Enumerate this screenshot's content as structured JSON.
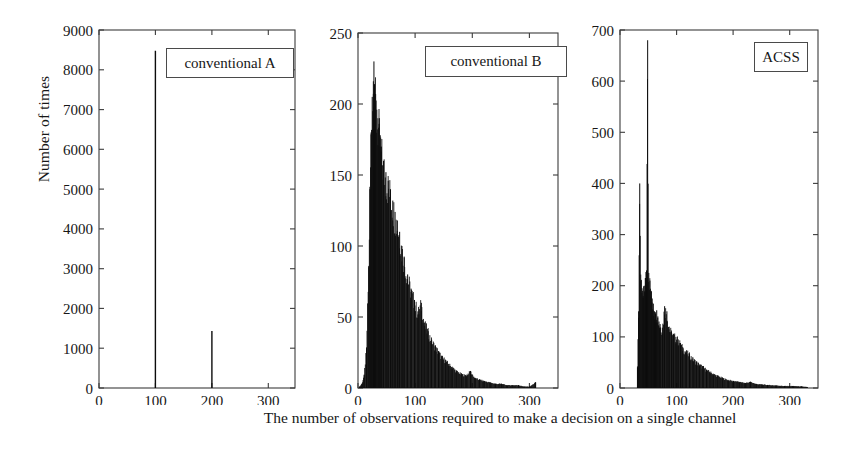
{
  "figure": {
    "xlabel": "The number of observations required to make a decision on a single channel",
    "ylabel": "Number of times"
  },
  "panels": [
    {
      "id": "panel-conventional-a",
      "legend": "conventional A",
      "yticks": [
        "0",
        "1000",
        "2000",
        "3000",
        "4000",
        "5000",
        "6000",
        "7000",
        "8000",
        "9000"
      ],
      "xticks": [
        "0",
        "100",
        "200",
        "300"
      ]
    },
    {
      "id": "panel-conventional-b",
      "legend": "conventional B",
      "yticks": [
        "0",
        "50",
        "100",
        "150",
        "200",
        "250"
      ],
      "xticks": [
        "0",
        "100",
        "200",
        "300"
      ]
    },
    {
      "id": "panel-acss",
      "legend": "ACSS",
      "yticks": [
        "0",
        "100",
        "200",
        "300",
        "400",
        "500",
        "600",
        "700"
      ],
      "xticks": [
        "0",
        "100",
        "200",
        "300"
      ]
    }
  ],
  "chart_data": [
    {
      "type": "bar",
      "title": "conventional A",
      "xlabel": "The number of observations required to make a decision on a single channel",
      "ylabel": "Number of times",
      "xlim": [
        0,
        350
      ],
      "ylim": [
        0,
        9000
      ],
      "xticks": [
        0,
        100,
        200,
        300
      ],
      "yticks": [
        0,
        1000,
        2000,
        3000,
        4000,
        5000,
        6000,
        7000,
        8000,
        9000
      ],
      "grid": false,
      "legend_position": "top-right",
      "note": "Two discrete spikes only; all other bins are zero.",
      "x": [
        100,
        200
      ],
      "values": [
        8480,
        1430
      ]
    },
    {
      "type": "bar",
      "title": "conventional B",
      "xlabel": "The number of observations required to make a decision on a single channel",
      "ylabel": "Number of times",
      "xlim": [
        0,
        350
      ],
      "ylim": [
        0,
        250
      ],
      "xticks": [
        0,
        100,
        200,
        300
      ],
      "yticks": [
        0,
        50,
        100,
        150,
        200,
        250
      ],
      "grid": false,
      "legend_position": "top-right",
      "note": "Right-skewed unimodal histogram, mode near 27, peak 230, long tail to ~310.",
      "x": [
        2,
        6,
        10,
        14,
        18,
        20,
        22,
        24,
        26,
        27,
        28,
        30,
        32,
        34,
        36,
        38,
        40,
        44,
        48,
        52,
        56,
        60,
        64,
        68,
        72,
        76,
        80,
        86,
        92,
        98,
        104,
        110,
        116,
        122,
        128,
        134,
        140,
        146,
        152,
        158,
        164,
        172,
        180,
        188,
        196,
        204,
        212,
        220,
        230,
        240,
        250,
        260,
        270,
        280,
        290,
        300,
        310
      ],
      "values": [
        1,
        3,
        9,
        28,
        86,
        140,
        180,
        205,
        216,
        230,
        214,
        207,
        196,
        190,
        186,
        178,
        170,
        160,
        152,
        146,
        140,
        132,
        124,
        118,
        110,
        100,
        92,
        80,
        70,
        62,
        54,
        60,
        46,
        40,
        34,
        30,
        26,
        22,
        20,
        17,
        15,
        12,
        10,
        9,
        12,
        7,
        6,
        5,
        4,
        3,
        3,
        2,
        2,
        2,
        1,
        1,
        4
      ]
    },
    {
      "type": "bar",
      "title": "ACSS",
      "xlabel": "The number of observations required to make a decision on a single channel",
      "ylabel": "Number of times",
      "xlim": [
        0,
        350
      ],
      "ylim": [
        0,
        700
      ],
      "xticks": [
        0,
        100,
        200,
        300
      ],
      "yticks": [
        0,
        100,
        200,
        300,
        400,
        500,
        600,
        700
      ],
      "grid": false,
      "legend_position": "top-right",
      "note": "Sharp onset near 30; narrow spike of 680 at x=48; secondary spike 400 at x=34; broad decaying tail to ~330.",
      "x": [
        30,
        32,
        34,
        36,
        38,
        40,
        42,
        44,
        46,
        48,
        50,
        52,
        54,
        56,
        58,
        60,
        62,
        64,
        66,
        68,
        70,
        74,
        78,
        82,
        86,
        90,
        94,
        98,
        102,
        106,
        110,
        116,
        122,
        128,
        134,
        140,
        146,
        152,
        158,
        164,
        172,
        180,
        190,
        200,
        210,
        220,
        230,
        240,
        250,
        260,
        275,
        290,
        305,
        320,
        330
      ],
      "values": [
        40,
        150,
        400,
        210,
        195,
        180,
        200,
        215,
        230,
        680,
        225,
        210,
        190,
        175,
        165,
        150,
        145,
        152,
        140,
        130,
        125,
        118,
        160,
        150,
        120,
        110,
        104,
        100,
        95,
        88,
        80,
        72,
        66,
        58,
        52,
        46,
        42,
        36,
        32,
        28,
        24,
        20,
        16,
        14,
        12,
        10,
        12,
        8,
        7,
        6,
        5,
        4,
        4,
        3,
        2
      ]
    }
  ]
}
